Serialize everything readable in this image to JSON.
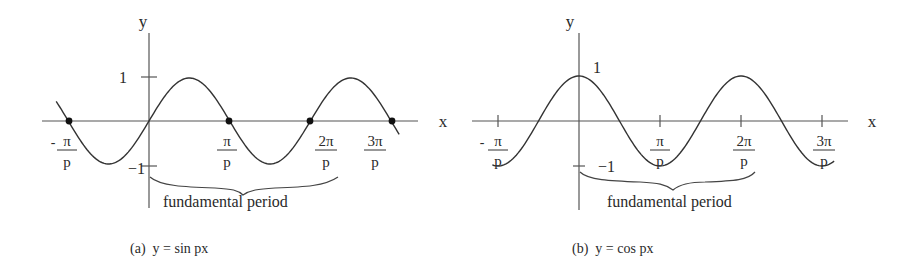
{
  "panels": [
    {
      "id": "a",
      "caption": "(a)  y = sin px",
      "function": "sin",
      "axis_labels": {
        "x": "x",
        "y": "y"
      },
      "y_ticks": {
        "pos": "1",
        "neg": "−1"
      },
      "x_ticks": [
        {
          "sign": "-",
          "num": "π",
          "den": "p"
        },
        {
          "sign": "",
          "num": "π",
          "den": "p"
        },
        {
          "sign": "",
          "num": "2π",
          "den": "p"
        },
        {
          "sign": "",
          "num": "3π",
          "den": "p"
        }
      ],
      "brace_label": "fundamental period",
      "marked_zeros": true
    },
    {
      "id": "b",
      "caption": "(b)  y = cos px",
      "function": "cos",
      "axis_labels": {
        "x": "x",
        "y": "y"
      },
      "y_ticks": {
        "pos": "1",
        "neg": "−1"
      },
      "x_ticks": [
        {
          "sign": "-",
          "num": "π",
          "den": "p"
        },
        {
          "sign": "",
          "num": "π",
          "den": "p"
        },
        {
          "sign": "",
          "num": "2π",
          "den": "p"
        },
        {
          "sign": "",
          "num": "3π",
          "den": "p"
        }
      ],
      "brace_label": "fundamental period",
      "marked_zeros": false
    }
  ],
  "chart_data": [
    {
      "type": "line",
      "title": "(a) y = sin px",
      "xlabel": "x",
      "ylabel": "y",
      "x_tick_labels": [
        "-π/p",
        "π/p",
        "2π/p",
        "3π/p"
      ],
      "x_tick_values_in_pi_over_p": [
        -1,
        1,
        2,
        3
      ],
      "y_tick_labels": [
        "1",
        "-1"
      ],
      "ylim": [
        -1,
        1
      ],
      "xrange_in_pi_over_p": [
        -1.15,
        3.1
      ],
      "series": [
        {
          "name": "sin px",
          "formula": "y = sin(px)"
        }
      ],
      "marked_points": [
        [
          -1,
          0
        ],
        [
          0,
          0
        ],
        [
          1,
          0
        ],
        [
          2,
          0
        ],
        [
          3,
          0
        ]
      ],
      "annotation": "fundamental period (0 to 2π/p)"
    },
    {
      "type": "line",
      "title": "(b) y = cos px",
      "xlabel": "x",
      "ylabel": "y",
      "x_tick_labels": [
        "-π/p",
        "π/p",
        "2π/p",
        "3π/p"
      ],
      "x_tick_values_in_pi_over_p": [
        -1,
        1,
        2,
        3
      ],
      "y_tick_labels": [
        "1",
        "-1"
      ],
      "ylim": [
        -1,
        1
      ],
      "xrange_in_pi_over_p": [
        -1.07,
        3.15
      ],
      "series": [
        {
          "name": "cos px",
          "formula": "y = cos(px)"
        }
      ],
      "annotation": "fundamental period (0 to 2π/p)"
    }
  ]
}
